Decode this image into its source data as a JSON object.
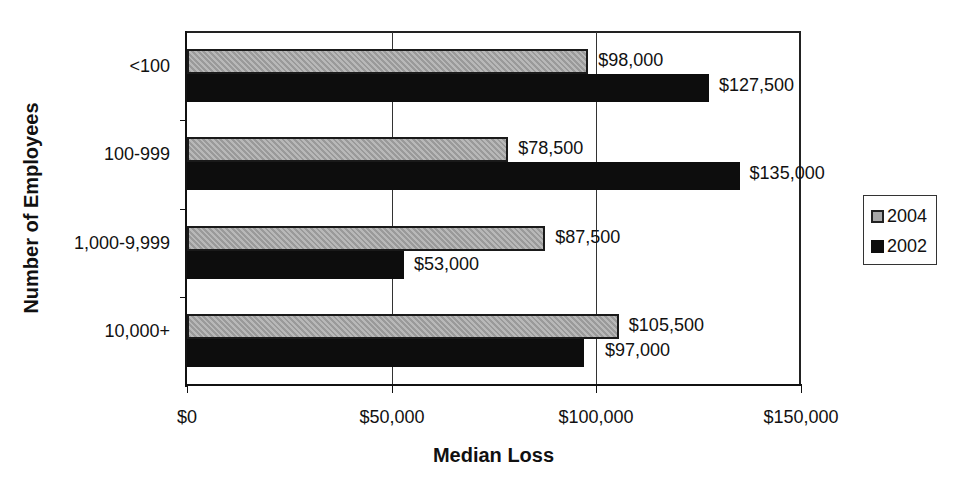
{
  "chart_data": {
    "type": "bar",
    "orientation": "horizontal",
    "xlabel": "Median Loss",
    "ylabel": "Number of Employees",
    "categories": [
      "<100",
      "100-999",
      "1,000-9,999",
      "10,000+"
    ],
    "series": [
      {
        "name": "2004",
        "values": [
          98000,
          78500,
          87500,
          105500
        ],
        "labels": [
          "$98,000",
          "$78,500",
          "$87,500",
          "$105,500"
        ],
        "color": "#a8a8a8"
      },
      {
        "name": "2002",
        "values": [
          127500,
          135000,
          53000,
          97000
        ],
        "labels": [
          "$127,500",
          "$135,000",
          "$53,000",
          "$97,000"
        ],
        "color": "#0d0d0d"
      }
    ],
    "xlim": [
      0,
      150000
    ],
    "xticks": [
      0,
      50000,
      100000,
      150000
    ],
    "xtick_labels": [
      "$0",
      "$50,000",
      "$100,000",
      "$150,000"
    ],
    "grid": "vertical major gridlines",
    "legend_position": "right"
  },
  "legend": {
    "items": [
      {
        "label": "2004"
      },
      {
        "label": "2002"
      }
    ]
  }
}
